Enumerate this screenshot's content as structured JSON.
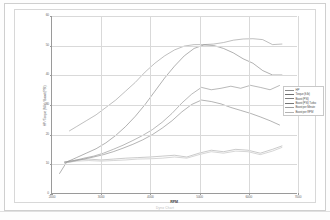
{
  "page": {
    "caption": "Dyno Chart"
  },
  "chart_data": {
    "type": "line",
    "title": "",
    "xlabel": "RPM",
    "ylabel": "HP / Torque (ft-lb) / Boost (PSI)",
    "xlim": [
      2000,
      7000
    ],
    "ylim": [
      0,
      60
    ],
    "xticks": [
      2000,
      3000,
      4000,
      5000,
      6000,
      7000
    ],
    "yticks": [
      0,
      10,
      20,
      30,
      40,
      50,
      60
    ],
    "grid": true,
    "legend_position": "right",
    "x": [
      2200,
      2400,
      2600,
      2800,
      3000,
      3200,
      3400,
      3600,
      3800,
      4000,
      4200,
      4400,
      4600,
      4800,
      5000,
      5200,
      5400,
      5600,
      5800,
      6000,
      6200,
      6400,
      6600,
      6800
    ],
    "series": [
      {
        "name": "HP",
        "color": "#8a8a8a",
        "x": [
          2350,
          2500,
          2700,
          2900,
          3100,
          3300,
          3500,
          3700,
          3900,
          4100,
          4300,
          4500,
          4700,
          4900,
          5100,
          5300,
          5500,
          5700,
          5900,
          6100,
          6300,
          6500,
          6700
        ],
        "values": [
          21.0,
          22.5,
          24.5,
          26.5,
          29.0,
          31.5,
          34.5,
          37.5,
          41.0,
          44.0,
          46.5,
          48.5,
          49.8,
          50.3,
          50.3,
          50.5,
          51.0,
          51.8,
          52.2,
          52.3,
          52.0,
          50.3,
          50.5
        ]
      },
      {
        "name": "Torque (ft-lb)",
        "color": "#6f6f6f",
        "x": [
          2150,
          2300,
          2500,
          2700,
          2900,
          3100,
          3300,
          3500,
          3700,
          3900,
          4100,
          4300,
          4500,
          4700,
          4900,
          5100,
          5300,
          5500,
          5700,
          5900,
          6100,
          6300,
          6500,
          6700
        ],
        "values": [
          6.5,
          10.5,
          12.0,
          13.5,
          15.0,
          17.0,
          19.5,
          22.5,
          26.0,
          30.0,
          34.5,
          39.0,
          43.0,
          46.5,
          49.0,
          50.2,
          50.0,
          49.0,
          47.5,
          45.5,
          44.0,
          41.5,
          40.0,
          40.0
        ]
      },
      {
        "name": "Boost (PSI)",
        "color": "#7e7e7e",
        "x": [
          2250,
          2450,
          2650,
          2850,
          3050,
          3250,
          3450,
          3650,
          3850,
          4050,
          4250,
          4450,
          4650,
          4850,
          5050,
          5250,
          5450,
          5650,
          5850,
          6050,
          6250,
          6450,
          6650
        ],
        "values": [
          10.5,
          11.0,
          11.8,
          12.5,
          13.5,
          14.8,
          16.2,
          17.8,
          19.5,
          21.5,
          24.0,
          27.0,
          30.5,
          33.5,
          35.8,
          35.0,
          35.5,
          36.2,
          35.5,
          36.5,
          35.8,
          35.0,
          36.5
        ]
      },
      {
        "name": "Boost (PSI) Turbo",
        "color": "#767676",
        "x": [
          2250,
          2450,
          2650,
          2850,
          3050,
          3250,
          3450,
          3650,
          3850,
          4050,
          4250,
          4450,
          4650,
          4850,
          5050,
          5250,
          5450,
          5650,
          5850,
          6050,
          6250,
          6450,
          6650
        ],
        "values": [
          10.2,
          10.8,
          11.5,
          12.2,
          13.0,
          14.0,
          15.2,
          16.5,
          18.0,
          19.8,
          22.0,
          24.5,
          27.5,
          30.0,
          31.5,
          31.0,
          30.2,
          29.0,
          28.0,
          27.0,
          25.8,
          24.5,
          23.0
        ]
      },
      {
        "name": "Boost per Minute",
        "color": "#9d9d9d",
        "x": [
          2250,
          2500,
          2750,
          3000,
          3250,
          3500,
          3750,
          4000,
          4250,
          4500,
          4750,
          5000,
          5250,
          5500,
          5750,
          6000,
          6250,
          6500,
          6700
        ],
        "values": [
          10.5,
          11.2,
          11.5,
          11.2,
          11.5,
          11.8,
          12.0,
          12.2,
          12.5,
          12.8,
          12.2,
          13.5,
          14.5,
          14.0,
          14.8,
          14.5,
          13.5,
          14.8,
          16.0
        ]
      },
      {
        "name": "Boost per RPM",
        "color": "#b3b3b3",
        "x": [
          2250,
          2500,
          2750,
          3000,
          3250,
          3500,
          3750,
          4000,
          4250,
          4500,
          4750,
          5000,
          5250,
          5500,
          5750,
          6000,
          6250,
          6500,
          6700
        ],
        "values": [
          10.2,
          10.8,
          11.0,
          10.8,
          11.0,
          11.2,
          11.5,
          11.6,
          11.8,
          12.2,
          11.8,
          13.0,
          14.0,
          13.5,
          14.2,
          14.0,
          13.0,
          14.2,
          15.5
        ]
      }
    ]
  }
}
